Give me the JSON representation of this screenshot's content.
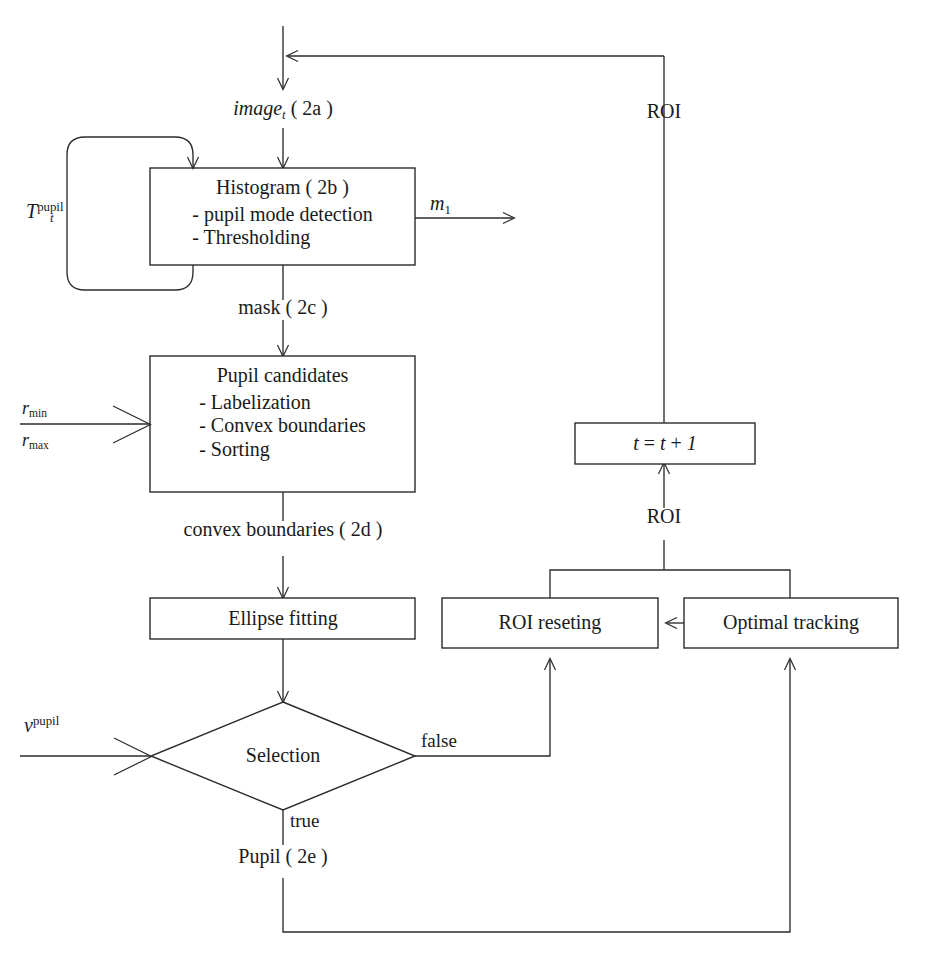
{
  "diagram": {
    "type": "flowchart",
    "nodes": [
      {
        "id": "histogram",
        "shape": "rectangle",
        "title": "Histogram ( 2b )",
        "lines": [
          "- pupil mode detection",
          "- Thresholding"
        ]
      },
      {
        "id": "pupil-candidates",
        "shape": "rectangle",
        "title": "Pupil candidates",
        "lines": [
          "- Labelization",
          "- Convex boundaries",
          "- Sorting"
        ]
      },
      {
        "id": "ellipse-fitting",
        "shape": "rectangle",
        "title": "Ellipse fitting",
        "lines": []
      },
      {
        "id": "selection",
        "shape": "diamond",
        "title": "Selection",
        "lines": []
      },
      {
        "id": "roi-reseting",
        "shape": "rectangle",
        "title": "ROI reseting",
        "lines": []
      },
      {
        "id": "optimal-tracking",
        "shape": "rectangle",
        "title": "Optimal tracking",
        "lines": []
      },
      {
        "id": "time-increment",
        "shape": "rectangle",
        "title": "t = t + 1",
        "lines": []
      }
    ],
    "edge_labels": {
      "image_t": "image",
      "image_t_sub": "t",
      "image_t_tag": "( 2a )",
      "mask": "mask ( 2c )",
      "convex_boundaries": "convex boundaries ( 2d )",
      "pupil_out": "Pupil ( 2e )",
      "roi_top": "ROI",
      "roi_mid": "ROI",
      "m_symbol": "m",
      "m_sub": "1",
      "branch_false": "false",
      "branch_true": "true"
    },
    "parameters": {
      "threshold_symbol": "T",
      "threshold_sub": "t",
      "threshold_sup": "pupil",
      "r_min_symbol": "r",
      "r_min_sub": "min",
      "r_max_symbol": "r",
      "r_max_sub": "max",
      "nu_symbol": "ν",
      "nu_sup": "pupil"
    },
    "time_box": {
      "var": "t",
      "equals": "=",
      "plus": "+",
      "one": "1"
    },
    "colors": {
      "stroke": "#2b2b2b",
      "background": "#ffffff",
      "text": "#1a1a1a"
    }
  }
}
